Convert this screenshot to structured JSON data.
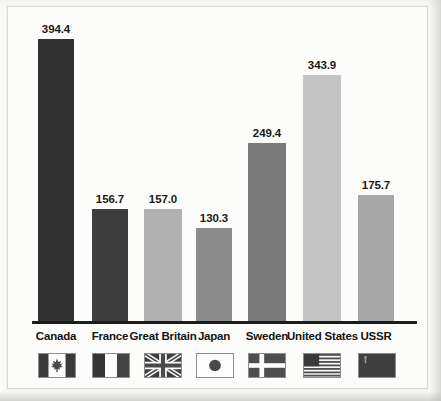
{
  "chart_data": {
    "type": "bar",
    "title": "",
    "xlabel": "",
    "ylabel": "Energy consumption in Btu",
    "categories": [
      "Canada",
      "France",
      "Great Britain",
      "Japan",
      "Sweden",
      "United States",
      "USSR"
    ],
    "values": [
      394.4,
      156.7,
      157.0,
      130.3,
      249.4,
      343.9,
      175.7
    ],
    "value_labels": [
      "394.4",
      "156.7",
      "157.0",
      "130.3",
      "249.4",
      "343.9",
      "175.7"
    ],
    "bar_colors": [
      "#323232",
      "#3d3d3d",
      "#b1b1b1",
      "#8c8c8c",
      "#7a7a7a",
      "#c3c3c3",
      "#a7a7a7"
    ],
    "ylim": [
      0,
      430
    ],
    "grid": false,
    "legend": false,
    "axis_line": "baseline-only",
    "icons": [
      "flag-canada-icon",
      "flag-france-icon",
      "flag-great-britain-icon",
      "flag-japan-icon",
      "flag-sweden-icon",
      "flag-united-states-icon",
      "flag-ussr-icon"
    ]
  },
  "figure": {
    "background_ghost_text": {
      "line1": "Chapter 8 Tables",
      "line2": "Consumption of energy",
      "line3": "energy auditing",
      "line4": "1980"
    }
  }
}
